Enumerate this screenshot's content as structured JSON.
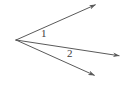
{
  "figure": {
    "background_color": "#ffffff",
    "stroke_color": "#5a5a5a",
    "label_color": "#3d3d3d",
    "stroke_width": 1,
    "width": 123,
    "height": 87
  },
  "vertex": {
    "name": "common-vertex",
    "x": 16,
    "y": 40
  },
  "rays": [
    {
      "id": "ray-upper",
      "label": "",
      "from_x": 16,
      "from_y": 40,
      "to_x": 97,
      "to_y": 4,
      "arrowhead": true
    },
    {
      "id": "ray-middle",
      "label": "",
      "from_x": 16,
      "from_y": 40,
      "to_x": 121,
      "to_y": 56,
      "arrowhead": true
    },
    {
      "id": "ray-lower",
      "label": "",
      "from_x": 16,
      "from_y": 40,
      "to_x": 96,
      "to_y": 76,
      "arrowhead": true
    }
  ],
  "angle_labels": [
    {
      "id": "angle-1",
      "text": "1",
      "x": 44,
      "y": 34,
      "between_rays": [
        "ray-upper",
        "ray-middle"
      ]
    },
    {
      "id": "angle-2",
      "text": "2",
      "x": 71,
      "y": 54,
      "between_rays": [
        "ray-middle",
        "ray-lower"
      ]
    }
  ]
}
